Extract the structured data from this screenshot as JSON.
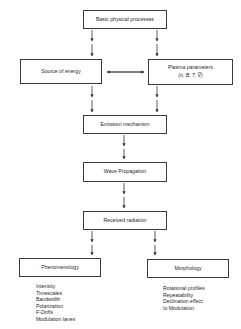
{
  "diagram": {
    "nodes": {
      "basic": {
        "label": "Basic physical processes"
      },
      "source": {
        "label": "Source of energy"
      },
      "plasma": {
        "label": "Plasma parameters",
        "sublabel": "(n, B, T, V̅)"
      },
      "emission": {
        "label": "Emission mechanism"
      },
      "wave": {
        "label": "Wave Propagation"
      },
      "received": {
        "label": "Received radiation"
      },
      "phenomenology": {
        "label": "Phenomenology"
      },
      "morphology": {
        "label": "Morphology"
      }
    },
    "phenomenology_items": [
      "Intensity",
      "Timescales",
      "Bandwidth",
      "Polarization",
      "F-Drifts",
      "Modulation lanes"
    ],
    "morphology_items": [
      "Rotational profiles",
      "Repeatability",
      "Declination effect",
      "Io Modulation"
    ],
    "edges": [
      {
        "from": "basic",
        "to": "source"
      },
      {
        "from": "basic",
        "to": "plasma"
      },
      {
        "from": "source",
        "to": "plasma",
        "bidirectional": true
      },
      {
        "from": "source",
        "to": "emission"
      },
      {
        "from": "plasma",
        "to": "emission"
      },
      {
        "from": "emission",
        "to": "wave"
      },
      {
        "from": "wave",
        "to": "received"
      },
      {
        "from": "received",
        "to": "phenomenology"
      },
      {
        "from": "received",
        "to": "morphology"
      }
    ]
  }
}
